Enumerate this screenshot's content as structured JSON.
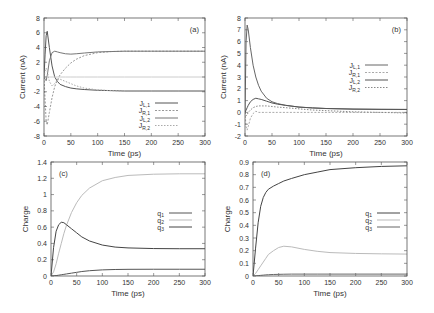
{
  "chart_data": [
    {
      "id": "a",
      "type": "line",
      "panel_label": "(a)",
      "xlabel": "Time (ps)",
      "ylabel": "Current (nA)",
      "xlim": [
        0,
        300
      ],
      "ylim": [
        -8,
        8
      ],
      "xticks": [
        0,
        50,
        100,
        150,
        200,
        250,
        300
      ],
      "yticks": [
        -8,
        -6,
        -4,
        -2,
        0,
        2,
        4,
        6,
        8
      ],
      "frame": {
        "left": 44,
        "top": 18,
        "right": 205,
        "bottom": 136
      },
      "legend": {
        "x": 150,
        "y": 103,
        "position": "lower right"
      },
      "grid": false,
      "x": [
        0,
        2,
        4,
        6,
        10,
        15,
        20,
        25,
        30,
        40,
        50,
        60,
        75,
        100,
        125,
        150,
        200,
        250,
        300
      ],
      "series": [
        {
          "name": "J_L,1",
          "base": "J",
          "sub": "L,1",
          "color": "#555555",
          "dash": "",
          "values": [
            0,
            3.0,
            5.6,
            6.2,
            4.0,
            1.5,
            0.0,
            -0.6,
            -1.0,
            -1.3,
            -1.5,
            -1.6,
            -1.7,
            -1.8,
            -1.85,
            -1.9,
            -1.9,
            -1.9,
            -1.9
          ]
        },
        {
          "name": "J_R,1",
          "base": "J",
          "sub": "R,1",
          "color": "#999999",
          "dash": "2,1.5",
          "values": [
            0,
            -3.0,
            -6.0,
            -6.5,
            -4.8,
            -2.8,
            -1.3,
            -0.4,
            0.3,
            1.2,
            1.9,
            2.4,
            2.9,
            3.3,
            3.45,
            3.5,
            3.5,
            3.5,
            3.5
          ]
        },
        {
          "name": "J_L,2",
          "base": "J",
          "sub": "L,2",
          "color": "#777777",
          "dash": "",
          "values": [
            0,
            -0.3,
            -0.5,
            0.2,
            2.2,
            3.3,
            3.5,
            3.4,
            3.3,
            3.15,
            3.1,
            3.15,
            3.25,
            3.4,
            3.45,
            3.5,
            3.5,
            3.5,
            3.5
          ]
        },
        {
          "name": "J_R,2",
          "base": "J",
          "sub": "R,2",
          "color": "#aaaaaa",
          "dash": "1.5,1.5",
          "values": [
            0,
            0.8,
            1.2,
            0.8,
            -0.6,
            -1.2,
            -0.9,
            -0.4,
            -0.3,
            -0.6,
            -0.9,
            -1.2,
            -1.5,
            -1.75,
            -1.85,
            -1.9,
            -1.9,
            -1.9,
            -1.9
          ]
        },
        {
          "name": "zero",
          "base": "",
          "sub": "",
          "color": "#cccccc",
          "dash": "",
          "legend": false,
          "values": [
            0,
            0,
            0,
            0,
            0,
            0,
            0,
            0,
            0,
            0,
            0,
            0,
            0,
            0,
            0,
            0,
            0,
            0,
            0
          ]
        }
      ]
    },
    {
      "id": "b",
      "type": "line",
      "panel_label": "(b)",
      "xlabel": "Time (ps)",
      "ylabel": "Current (nA)",
      "xlim": [
        0,
        300
      ],
      "ylim": [
        -2,
        8
      ],
      "xticks": [
        0,
        50,
        100,
        150,
        200,
        250,
        300
      ],
      "yticks": [
        -2,
        -1,
        0,
        1,
        2,
        3,
        4,
        5,
        6,
        7,
        8
      ],
      "frame": {
        "left": 245,
        "top": 18,
        "right": 407,
        "bottom": 136
      },
      "legend": {
        "x": 360,
        "y": 65,
        "position": "right"
      },
      "grid": false,
      "x": [
        0,
        2,
        4,
        6,
        10,
        15,
        20,
        25,
        30,
        40,
        50,
        60,
        75,
        100,
        125,
        150,
        200,
        250,
        300
      ],
      "series": [
        {
          "name": "J_L,1",
          "base": "J",
          "sub": "L,1",
          "color": "#666666",
          "dash": "",
          "values": [
            0,
            6.0,
            7.4,
            7.0,
            5.5,
            4.0,
            3.0,
            2.3,
            1.8,
            1.2,
            0.9,
            0.75,
            0.6,
            0.45,
            0.38,
            0.33,
            0.28,
            0.26,
            0.25
          ]
        },
        {
          "name": "J_R,1",
          "base": "J",
          "sub": "R,1",
          "color": "#aaaaaa",
          "dash": "2,1.5",
          "values": [
            0,
            -1.2,
            -1.5,
            -1.2,
            -0.5,
            -0.1,
            0.1,
            0.0,
            0.0,
            0.0,
            0.0,
            0.0,
            0.0,
            0.0,
            0.0,
            0.0,
            0.0,
            0.0,
            0.0
          ]
        },
        {
          "name": "J_L,2",
          "base": "J",
          "sub": "L,2",
          "color": "#555555",
          "dash": "",
          "values": [
            0,
            0.2,
            0.4,
            0.6,
            0.9,
            1.1,
            1.2,
            1.15,
            1.1,
            0.95,
            0.8,
            0.7,
            0.6,
            0.45,
            0.38,
            0.33,
            0.28,
            0.26,
            0.25
          ]
        },
        {
          "name": "J_R,2",
          "base": "J",
          "sub": "R,2",
          "color": "#888888",
          "dash": "1.5,1.5",
          "values": [
            0,
            -0.3,
            -0.2,
            0.0,
            0.2,
            0.4,
            0.5,
            0.55,
            0.55,
            0.55,
            0.5,
            0.45,
            0.4,
            0.3,
            0.2,
            0.15,
            0.05,
            0.0,
            -0.05
          ]
        }
      ]
    },
    {
      "id": "c",
      "type": "line",
      "panel_label": "(c)",
      "xlabel": "Time (ps)",
      "ylabel": "Charge",
      "xlim": [
        0,
        300
      ],
      "ylim": [
        0,
        1.4
      ],
      "xticks": [
        0,
        50,
        100,
        150,
        200,
        250,
        300
      ],
      "yticks": [
        0,
        0.2,
        0.4,
        0.6,
        0.8,
        1,
        1.2,
        1.4
      ],
      "frame": {
        "left": 51,
        "top": 162,
        "right": 205,
        "bottom": 276
      },
      "legend": {
        "x": 164,
        "y": 213,
        "position": "right"
      },
      "grid": false,
      "x": [
        0,
        5,
        10,
        15,
        20,
        25,
        30,
        40,
        50,
        60,
        75,
        100,
        125,
        150,
        200,
        250,
        300
      ],
      "series": [
        {
          "name": "q_1",
          "base": "q",
          "sub": "1",
          "color": "#555555",
          "dash": "",
          "values": [
            0,
            0.002,
            0.005,
            0.01,
            0.015,
            0.02,
            0.025,
            0.035,
            0.045,
            0.055,
            0.065,
            0.075,
            0.08,
            0.082,
            0.083,
            0.083,
            0.083
          ]
        },
        {
          "name": "q_2",
          "base": "q",
          "sub": "2",
          "color": "#bbbbbb",
          "dash": "",
          "values": [
            0,
            0.05,
            0.15,
            0.28,
            0.4,
            0.52,
            0.62,
            0.78,
            0.9,
            0.99,
            1.08,
            1.17,
            1.21,
            1.235,
            1.25,
            1.255,
            1.255
          ]
        },
        {
          "name": "q_3",
          "base": "q",
          "sub": "3",
          "color": "#444444",
          "dash": "",
          "values": [
            0,
            0.35,
            0.55,
            0.63,
            0.66,
            0.655,
            0.63,
            0.58,
            0.53,
            0.48,
            0.43,
            0.38,
            0.355,
            0.345,
            0.337,
            0.335,
            0.335
          ]
        }
      ]
    },
    {
      "id": "d",
      "type": "line",
      "panel_label": "(d)",
      "xlabel": "Time (ps)",
      "ylabel": "Charge",
      "xlim": [
        0,
        300
      ],
      "ylim": [
        0,
        0.9
      ],
      "xticks": [
        0,
        50,
        100,
        150,
        200,
        250,
        300
      ],
      "yticks": [
        0,
        0.1,
        0.2,
        0.3,
        0.4,
        0.5,
        0.6,
        0.7,
        0.8,
        0.9
      ],
      "frame": {
        "left": 253,
        "top": 162,
        "right": 407,
        "bottom": 276
      },
      "legend": {
        "x": 372,
        "y": 213,
        "position": "right"
      },
      "grid": false,
      "x": [
        0,
        5,
        10,
        15,
        20,
        25,
        30,
        40,
        50,
        60,
        75,
        100,
        125,
        150,
        200,
        250,
        300
      ],
      "series": [
        {
          "name": "q_1",
          "base": "q",
          "sub": "1",
          "color": "#444444",
          "dash": "",
          "values": [
            0,
            0.22,
            0.42,
            0.55,
            0.62,
            0.66,
            0.685,
            0.71,
            0.73,
            0.75,
            0.77,
            0.8,
            0.82,
            0.84,
            0.855,
            0.865,
            0.87
          ]
        },
        {
          "name": "q_2",
          "base": "q",
          "sub": "2",
          "color": "#bbbbbb",
          "dash": "",
          "values": [
            0,
            0.02,
            0.05,
            0.08,
            0.11,
            0.14,
            0.17,
            0.2,
            0.225,
            0.235,
            0.23,
            0.21,
            0.195,
            0.185,
            0.178,
            0.175,
            0.173
          ]
        },
        {
          "name": "q_3",
          "base": "q",
          "sub": "3",
          "color": "#666666",
          "dash": "",
          "values": [
            0,
            0.001,
            0.003,
            0.005,
            0.007,
            0.009,
            0.01,
            0.012,
            0.013,
            0.014,
            0.015,
            0.015,
            0.015,
            0.015,
            0.015,
            0.015,
            0.015
          ]
        }
      ]
    }
  ]
}
